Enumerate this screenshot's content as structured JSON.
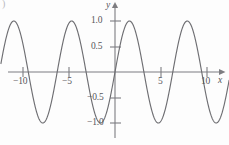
{
  "figure": {
    "corner_mark": ")",
    "background_color": "#fdfdfd",
    "curve_color": "#6e6e72",
    "axis_color": "#7d7d81",
    "text_color": "#56565a"
  },
  "axes": {
    "x_name": "x",
    "y_name": "y",
    "x_ticks": [
      {
        "label": "−10",
        "value": -10,
        "px": 23
      },
      {
        "label": "−5",
        "value": -5,
        "px": 69
      },
      {
        "label": "5",
        "value": 5,
        "px": 161
      },
      {
        "label": "10",
        "value": 10,
        "px": 207
      }
    ],
    "y_ticks": [
      {
        "label": "1.0",
        "value": 1.0,
        "px": 21
      },
      {
        "label": "0.5",
        "value": 0.5,
        "px": 47
      },
      {
        "label": "−0.5",
        "value": -0.5,
        "px": 98
      },
      {
        "label": "−1.0",
        "value": -1.0,
        "px": 123
      }
    ]
  },
  "chart_data": {
    "type": "line",
    "title": "",
    "xlabel": "x",
    "ylabel": "y",
    "xlim": [
      -12.4,
      12.4
    ],
    "ylim": [
      -1.4,
      1.4
    ],
    "grid": false,
    "legend": null,
    "series": [
      {
        "name": "y = sin(x)",
        "function": "sin",
        "amplitude": 1.0,
        "period": 6.283185307,
        "phase": 0,
        "x": [
          -12.4,
          -12.0,
          -11.6,
          -11.2,
          -10.8,
          -10.4,
          -10.0,
          -9.6,
          -9.2,
          -8.8,
          -8.4,
          -8.0,
          -7.6,
          -7.2,
          -6.8,
          -6.4,
          -6.0,
          -5.6,
          -5.2,
          -4.8,
          -4.4,
          -4.0,
          -3.6,
          -3.2,
          -2.8,
          -2.4,
          -2.0,
          -1.6,
          -1.2,
          -0.8,
          -0.4,
          0.0,
          0.4,
          0.8,
          1.2,
          1.6,
          2.0,
          2.4,
          2.8,
          3.2,
          3.6,
          4.0,
          4.4,
          4.8,
          5.2,
          5.6,
          6.0,
          6.4,
          6.8,
          7.2,
          7.6,
          8.0,
          8.4,
          8.8,
          9.2,
          9.6,
          10.0,
          10.4,
          10.8,
          11.2,
          11.6,
          12.0,
          12.4
        ],
        "y": [
          0.24,
          -0.54,
          -0.9,
          -0.98,
          -0.75,
          -0.25,
          0.54,
          0.17,
          0.22,
          0.6,
          0.85,
          0.99,
          0.97,
          0.79,
          0.49,
          0.12,
          0.28,
          0.63,
          0.88,
          0.996,
          0.95,
          0.76,
          0.44,
          0.06,
          -0.33,
          -0.68,
          -0.91,
          -0.9996,
          -0.93,
          -0.72,
          -0.39,
          0.0,
          0.39,
          0.72,
          0.93,
          0.9996,
          0.91,
          0.68,
          0.33,
          -0.06,
          -0.44,
          -0.76,
          -0.95,
          -0.996,
          -0.88,
          -0.63,
          -0.28,
          0.12,
          0.49,
          0.79,
          0.97,
          0.99,
          0.85,
          0.6,
          0.22,
          -0.17,
          -0.54,
          -0.83,
          -0.98,
          -0.99,
          -0.84,
          -0.54,
          -0.13
        ]
      }
    ],
    "zero_crossings": [
      -12.566,
      -9.425,
      -6.283,
      -3.142,
      0.0,
      3.142,
      6.283,
      9.425,
      12.566
    ],
    "maxima": [
      {
        "x": -10.996,
        "y": 1.0
      },
      {
        "x": -4.712,
        "y": 1.0
      },
      {
        "x": 1.571,
        "y": 1.0
      },
      {
        "x": 7.854,
        "y": 1.0
      }
    ],
    "minima": [
      {
        "x": -7.854,
        "y": -1.0
      },
      {
        "x": -1.571,
        "y": -1.0
      },
      {
        "x": 4.712,
        "y": -1.0
      },
      {
        "x": 10.996,
        "y": -1.0
      }
    ]
  }
}
